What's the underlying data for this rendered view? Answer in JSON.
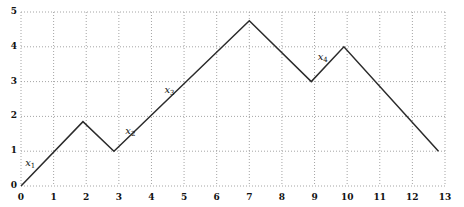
{
  "chart": {
    "title": "",
    "subtitle": "",
    "line_color": "#2b2b2b",
    "grid_color": "#9a9a9a",
    "axis_color": "#6b6b6b",
    "background": "#ffffff"
  },
  "chart_data": {
    "type": "line",
    "title": "",
    "xlabel": "",
    "ylabel": "",
    "xlim": [
      0,
      13
    ],
    "ylim": [
      0,
      5
    ],
    "grid": true,
    "grid_style": "dotted",
    "legend": "none",
    "xticks": [
      "0",
      "1",
      "2",
      "3",
      "4",
      "5",
      "6",
      "7",
      "8",
      "9",
      "10",
      "11",
      "12",
      "13"
    ],
    "yticks": [
      "0",
      "1",
      "2",
      "3",
      "4",
      "5"
    ],
    "series": [
      {
        "name": "piecewise-linear-path",
        "x": [
          0,
          1.9,
          2.85,
          7.0,
          8.9,
          9.9,
          12.8
        ],
        "y": [
          0,
          1.85,
          1.0,
          4.75,
          3.0,
          4.0,
          1.0
        ]
      }
    ],
    "annotations": [
      {
        "id": "x1",
        "text": "x",
        "sub": "1",
        "x": 0.28,
        "y": 0.62
      },
      {
        "id": "x2",
        "text": "x",
        "sub": "2",
        "x": 3.35,
        "y": 1.55
      },
      {
        "id": "x3",
        "text": "x",
        "sub": "3",
        "x": 4.55,
        "y": 2.72
      },
      {
        "id": "x4",
        "text": "x",
        "sub": "4",
        "x": 9.25,
        "y": 3.68
      }
    ]
  },
  "labels": {
    "y": [
      "5",
      "4",
      "3",
      "2",
      "1",
      "0"
    ],
    "x": [
      "0",
      "1",
      "2",
      "3",
      "4",
      "5",
      "6",
      "7",
      "8",
      "9",
      "10",
      "11",
      "12",
      "13"
    ],
    "seg": [
      {
        "base": "x",
        "sub": "1"
      },
      {
        "base": "x",
        "sub": "2"
      },
      {
        "base": "x",
        "sub": "3"
      },
      {
        "base": "x",
        "sub": "4"
      }
    ]
  }
}
